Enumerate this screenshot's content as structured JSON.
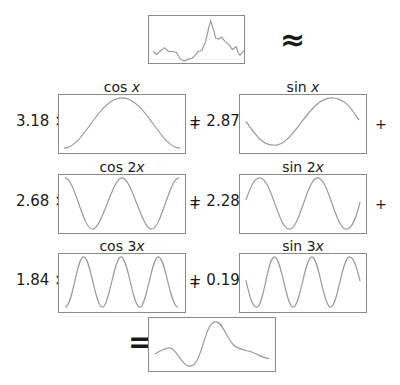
{
  "top": {
    "signal_label": "",
    "approx_symbol": "≈"
  },
  "terms": [
    {
      "func": "cos",
      "arg": "x",
      "coef": "3.18 ×",
      "position": "row1-left"
    },
    {
      "func": "sin",
      "arg": "x",
      "coef": "+ 2.87 ×",
      "position": "row1-right"
    },
    {
      "func": "cos",
      "arg": "2x",
      "coef": "2.68 ×",
      "position": "row2-left"
    },
    {
      "func": "sin",
      "arg": "2x",
      "coef": "+ 2.28 ×",
      "position": "row2-right"
    },
    {
      "func": "cos",
      "arg": "3x",
      "coef": "1.84 ×",
      "position": "row3-left"
    },
    {
      "func": "sin",
      "arg": "3x",
      "coef": "+ 0.19 ×",
      "position": "row3-right"
    }
  ],
  "labels": {
    "cos1": {
      "fn": "cos ",
      "arg": "x"
    },
    "sin1": {
      "fn": "sin ",
      "arg": "x"
    },
    "cos2": {
      "fn": "cos ",
      "arg": "2x",
      "num": "2",
      "var": "x"
    },
    "sin2": {
      "fn": "sin ",
      "arg": "2x",
      "num": "2",
      "var": "x"
    },
    "cos3": {
      "fn": "cos ",
      "arg": "3x",
      "num": "3",
      "var": "x"
    },
    "sin3": {
      "fn": "sin ",
      "arg": "3x",
      "num": "3",
      "var": "x"
    }
  },
  "coefs": {
    "cos1": "3.18 ×",
    "sin1": "+ 2.87 ×",
    "cos2": "2.68 ×",
    "sin2": "+ 2.28 ×",
    "cos3": "1.84 ×",
    "sin3": "+ 0.19 ×"
  },
  "plus_signs": [
    "+",
    "+",
    "+",
    "+"
  ],
  "result": {
    "equals_symbol": "="
  },
  "colors": {
    "curve": "#9a9a9a",
    "frame": "#8a8a8a",
    "text": "#1a1a1a"
  }
}
